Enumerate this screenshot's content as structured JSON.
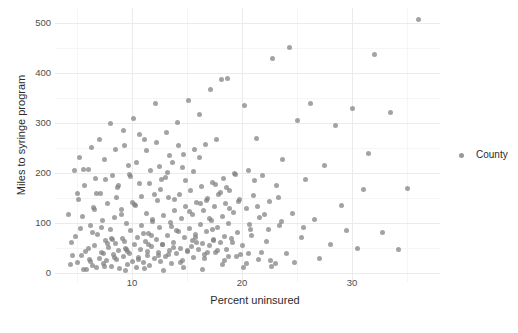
{
  "chart_data": {
    "type": "scatter",
    "title": "",
    "xlabel": "Percent uninsured",
    "ylabel": "Miles to syringe program",
    "xlim": [
      3.0,
      38.0
    ],
    "ylim": [
      -18,
      530
    ],
    "xticks": [
      10,
      20,
      30
    ],
    "yticks": [
      0,
      100,
      200,
      300,
      400,
      500
    ],
    "xticks_minor": [
      5,
      15,
      25,
      35
    ],
    "yticks_minor": [
      50,
      150,
      250,
      350,
      450
    ],
    "grid": true,
    "legend_position": "right",
    "point_color": "#808080",
    "point_opacity": 0.72,
    "series": [
      {
        "name": "County",
        "points": [
          [
            4.2,
            118
          ],
          [
            4.5,
            62
          ],
          [
            4.8,
            205
          ],
          [
            5.0,
            22
          ],
          [
            5.1,
            147
          ],
          [
            5.3,
            90
          ],
          [
            5.4,
            35
          ],
          [
            5.6,
            8
          ],
          [
            5.7,
            175
          ],
          [
            5.8,
            44
          ],
          [
            6.0,
            208
          ],
          [
            6.1,
            28
          ],
          [
            6.2,
            96
          ],
          [
            6.4,
            15
          ],
          [
            6.5,
            132
          ],
          [
            6.6,
            55
          ],
          [
            6.7,
            190
          ],
          [
            6.8,
            11
          ],
          [
            6.9,
            78
          ],
          [
            7.0,
            30
          ],
          [
            7.1,
            160
          ],
          [
            7.2,
            42
          ],
          [
            7.3,
            105
          ],
          [
            7.4,
            19
          ],
          [
            7.5,
            228
          ],
          [
            7.6,
            66
          ],
          [
            7.7,
            25
          ],
          [
            7.8,
            140
          ],
          [
            7.9,
            52
          ],
          [
            8.0,
            88
          ],
          [
            8.1,
            14
          ],
          [
            8.2,
            196
          ],
          [
            8.3,
            38
          ],
          [
            8.4,
            112
          ],
          [
            8.5,
            60
          ],
          [
            8.6,
            27
          ],
          [
            8.7,
            172
          ],
          [
            8.8,
            45
          ],
          [
            8.9,
            9
          ],
          [
            9.0,
            128
          ],
          [
            9.1,
            70
          ],
          [
            9.2,
            33
          ],
          [
            9.3,
            255
          ],
          [
            9.4,
            50
          ],
          [
            9.5,
            100
          ],
          [
            9.6,
            18
          ],
          [
            9.7,
            215
          ],
          [
            9.8,
            40
          ],
          [
            9.9,
            85
          ],
          [
            10.0,
            24
          ],
          [
            10.1,
            310
          ],
          [
            10.2,
            58
          ],
          [
            10.3,
            136
          ],
          [
            10.4,
            12
          ],
          [
            10.5,
            72
          ],
          [
            10.6,
            31
          ],
          [
            10.7,
            180
          ],
          [
            10.8,
            47
          ],
          [
            10.9,
            95
          ],
          [
            11.0,
            21
          ],
          [
            11.1,
            268
          ],
          [
            11.2,
            64
          ],
          [
            11.3,
            120
          ],
          [
            11.4,
            36
          ],
          [
            11.5,
            80
          ],
          [
            11.6,
            16
          ],
          [
            11.7,
            205
          ],
          [
            11.8,
            54
          ],
          [
            11.9,
            108
          ],
          [
            12.0,
            29
          ],
          [
            12.1,
            340
          ],
          [
            12.2,
            68
          ],
          [
            12.3,
            145
          ],
          [
            12.4,
            41
          ],
          [
            12.5,
            92
          ],
          [
            12.6,
            23
          ],
          [
            12.7,
            188
          ],
          [
            12.8,
            57
          ],
          [
            12.9,
            115
          ],
          [
            13.0,
            34
          ],
          [
            13.1,
            282
          ],
          [
            13.2,
            75
          ],
          [
            13.3,
            152
          ],
          [
            13.4,
            46
          ],
          [
            13.5,
            102
          ],
          [
            13.6,
            20
          ],
          [
            13.7,
            222
          ],
          [
            13.8,
            61
          ],
          [
            13.9,
            125
          ],
          [
            14.0,
            39
          ],
          [
            14.1,
            302
          ],
          [
            14.2,
            83
          ],
          [
            14.3,
            158
          ],
          [
            14.4,
            49
          ],
          [
            14.5,
            110
          ],
          [
            14.6,
            26
          ],
          [
            14.7,
            238
          ],
          [
            14.8,
            71
          ],
          [
            14.9,
            134
          ],
          [
            15.0,
            43
          ],
          [
            15.1,
            345
          ],
          [
            15.2,
            90
          ],
          [
            15.3,
            166
          ],
          [
            15.4,
            53
          ],
          [
            15.5,
            118
          ],
          [
            15.6,
            32
          ],
          [
            15.7,
            248
          ],
          [
            15.8,
            77
          ],
          [
            15.9,
            142
          ],
          [
            16.0,
            48
          ],
          [
            16.1,
            318
          ],
          [
            16.2,
            98
          ],
          [
            16.3,
            174
          ],
          [
            16.4,
            59
          ],
          [
            16.5,
            126
          ],
          [
            16.6,
            37
          ],
          [
            16.7,
            258
          ],
          [
            16.8,
            84
          ],
          [
            16.9,
            150
          ],
          [
            17.0,
            55
          ],
          [
            17.1,
            368
          ],
          [
            17.2,
            106
          ],
          [
            17.3,
            182
          ],
          [
            17.4,
            65
          ],
          [
            17.5,
            133
          ],
          [
            17.6,
            42
          ],
          [
            17.7,
            268
          ],
          [
            17.8,
            91
          ],
          [
            17.9,
            157
          ],
          [
            18.0,
            62
          ],
          [
            18.1,
            388
          ],
          [
            18.2,
            114
          ],
          [
            18.3,
            190
          ],
          [
            18.4,
            73
          ],
          [
            18.5,
            140
          ],
          [
            18.6,
            47
          ],
          [
            18.7,
            390
          ],
          [
            18.8,
            99
          ],
          [
            18.9,
            165
          ],
          [
            19.0,
            69
          ],
          [
            19.2,
            122
          ],
          [
            19.4,
            197
          ],
          [
            19.6,
            81
          ],
          [
            19.8,
            148
          ],
          [
            20.0,
            55
          ],
          [
            20.2,
            335
          ],
          [
            20.4,
            130
          ],
          [
            20.6,
            205
          ],
          [
            20.8,
            88
          ],
          [
            21.0,
            156
          ],
          [
            21.3,
            270
          ],
          [
            21.6,
            112
          ],
          [
            21.9,
            196
          ],
          [
            22.2,
            64
          ],
          [
            22.5,
            143
          ],
          [
            22.8,
            430
          ],
          [
            23.1,
            175
          ],
          [
            23.4,
            96
          ],
          [
            23.7,
            228
          ],
          [
            24.0,
            40
          ],
          [
            24.3,
            452
          ],
          [
            24.6,
            120
          ],
          [
            25.0,
            305
          ],
          [
            25.4,
            72
          ],
          [
            25.8,
            187
          ],
          [
            26.2,
            340
          ],
          [
            26.6,
            108
          ],
          [
            27.0,
            29
          ],
          [
            27.5,
            215
          ],
          [
            28.0,
            58
          ],
          [
            28.5,
            296
          ],
          [
            29.0,
            136
          ],
          [
            29.5,
            85
          ],
          [
            30.0,
            330
          ],
          [
            30.5,
            50
          ],
          [
            31.0,
            168
          ],
          [
            31.5,
            240
          ],
          [
            32.0,
            438
          ],
          [
            32.8,
            82
          ],
          [
            33.5,
            322
          ],
          [
            34.2,
            48
          ],
          [
            35.0,
            170
          ],
          [
            36.0,
            508
          ],
          [
            5.2,
            232
          ],
          [
            6.3,
            252
          ],
          [
            7.0,
            268
          ],
          [
            8.0,
            300
          ],
          [
            9.2,
            285
          ],
          [
            10.4,
            222
          ],
          [
            11.3,
            245
          ],
          [
            12.2,
            262
          ],
          [
            13.4,
            236
          ],
          [
            14.6,
            212
          ],
          [
            4.9,
            74
          ],
          [
            5.5,
            114
          ],
          [
            6.8,
            160
          ],
          [
            8.2,
            68
          ],
          [
            9.9,
            193
          ],
          [
            11.8,
            76
          ],
          [
            13.2,
            201
          ],
          [
            15.5,
            66
          ],
          [
            17.3,
            88
          ],
          [
            19.5,
            33
          ],
          [
            4.4,
            18
          ],
          [
            5.9,
            7
          ],
          [
            7.5,
            13
          ],
          [
            9.4,
            6
          ],
          [
            11.1,
            10
          ],
          [
            12.9,
            5
          ],
          [
            14.7,
            12
          ],
          [
            16.4,
            8
          ],
          [
            18.2,
            17
          ],
          [
            20.1,
            11
          ],
          [
            6.0,
            50
          ],
          [
            7.8,
            60
          ],
          [
            9.6,
            44
          ],
          [
            11.5,
            57
          ],
          [
            13.8,
            52
          ],
          [
            15.9,
            61
          ],
          [
            17.8,
            45
          ],
          [
            19.9,
            38
          ],
          [
            21.5,
            28
          ],
          [
            23.0,
            19
          ],
          [
            8.5,
            248
          ],
          [
            10.7,
            278
          ],
          [
            12.5,
            214
          ],
          [
            14.2,
            256
          ],
          [
            16.1,
            232
          ],
          [
            5.0,
            160
          ],
          [
            6.6,
            128
          ],
          [
            8.8,
            176
          ],
          [
            10.9,
            154
          ],
          [
            12.6,
            168
          ],
          [
            14.9,
            186
          ],
          [
            16.8,
            146
          ],
          [
            18.6,
            172
          ],
          [
            20.7,
            98
          ],
          [
            22.4,
            88
          ],
          [
            7.2,
            92
          ],
          [
            9.0,
            117
          ],
          [
            10.2,
            138
          ],
          [
            11.9,
            103
          ],
          [
            13.6,
            94
          ],
          [
            15.2,
            124
          ],
          [
            17.0,
            110
          ],
          [
            18.9,
            130
          ],
          [
            20.9,
            76
          ],
          [
            22.0,
            118
          ],
          [
            4.6,
            36
          ],
          [
            6.2,
            24
          ],
          [
            8.4,
            31
          ],
          [
            10.6,
            27
          ],
          [
            12.4,
            35
          ],
          [
            14.4,
            22
          ],
          [
            16.6,
            30
          ],
          [
            18.4,
            25
          ],
          [
            20.4,
            20
          ],
          [
            22.7,
            14
          ],
          [
            5.6,
            208
          ],
          [
            7.6,
            188
          ],
          [
            9.8,
            198
          ],
          [
            11.6,
            180
          ],
          [
            13.0,
            192
          ],
          [
            15.6,
            204
          ],
          [
            17.6,
            178
          ],
          [
            19.3,
            200
          ],
          [
            21.1,
            186
          ],
          [
            23.3,
            152
          ],
          [
            6.4,
            82
          ],
          [
            8.1,
            70
          ],
          [
            9.3,
            64
          ],
          [
            11.0,
            79
          ],
          [
            12.8,
            58
          ],
          [
            14.0,
            86
          ],
          [
            15.8,
            72
          ],
          [
            17.4,
            68
          ],
          [
            19.1,
            62
          ],
          [
            21.8,
            42
          ],
          [
            7.4,
            40
          ],
          [
            9.5,
            48
          ],
          [
            11.4,
            43
          ],
          [
            13.3,
            37
          ],
          [
            15.0,
            46
          ],
          [
            16.9,
            41
          ],
          [
            18.8,
            34
          ],
          [
            20.6,
            39
          ],
          [
            22.6,
            26
          ],
          [
            24.8,
            21
          ],
          [
            8.6,
            152
          ],
          [
            10.0,
            142
          ],
          [
            12.0,
            158
          ],
          [
            13.9,
            148
          ],
          [
            16.2,
            140
          ],
          [
            18.0,
            162
          ],
          [
            19.7,
            144
          ],
          [
            21.4,
            134
          ],
          [
            23.6,
            104
          ],
          [
            25.6,
            92
          ]
        ]
      }
    ]
  },
  "legend": {
    "title": "",
    "items": [
      {
        "label": "County",
        "color": "#808080"
      }
    ]
  }
}
